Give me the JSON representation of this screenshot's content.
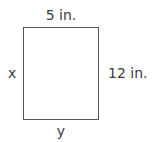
{
  "diagram": {
    "type": "rectangle",
    "labels": {
      "top": "5 in.",
      "right": "12 in.",
      "left": "x",
      "bottom": "y"
    },
    "colors": {
      "stroke": "#555555",
      "text": "#3a3a3a",
      "background": "#ffffff"
    }
  }
}
